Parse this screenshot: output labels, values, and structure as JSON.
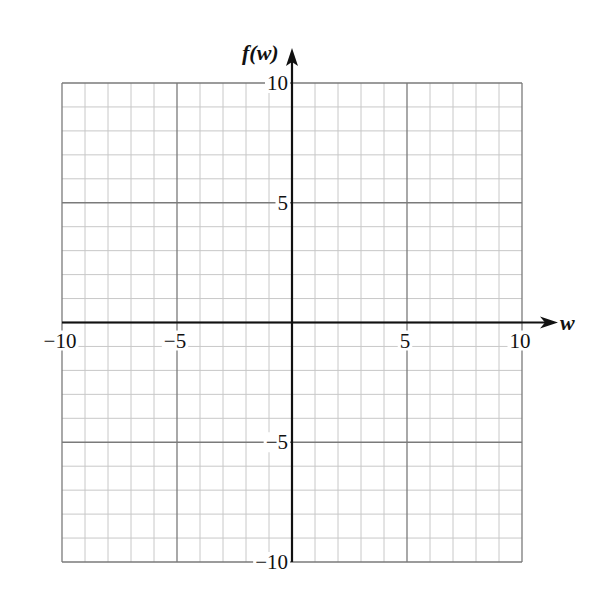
{
  "chart_data": {
    "type": "line",
    "title": "",
    "xlabel": "w",
    "ylabel": "f(w)",
    "xlim": [
      -10,
      10
    ],
    "ylim": [
      -10,
      10
    ],
    "grid": true,
    "minor_grid_step": 1,
    "major_grid_step": 5,
    "x_ticks": [
      -10,
      -5,
      5,
      10
    ],
    "x_tick_labels": [
      "−10",
      "−5",
      "5",
      "10"
    ],
    "y_ticks": [
      10,
      5,
      -5,
      -10
    ],
    "y_tick_labels": [
      "10",
      "5",
      "−5",
      "−10"
    ],
    "series": []
  },
  "colors": {
    "minor_grid": "#c8c8c8",
    "major_grid": "#7a7a7a",
    "axis": "#111111",
    "background": "#ffffff"
  }
}
